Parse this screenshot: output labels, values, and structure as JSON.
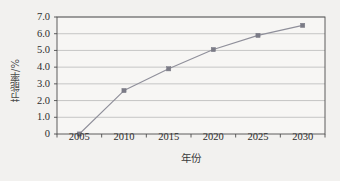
{
  "chart_data": {
    "type": "line",
    "title": "",
    "subtitle": "",
    "xlabel": "年份",
    "ylabel": "节能率/%",
    "categories": [
      "2005",
      "2010",
      "2015",
      "2020",
      "2025",
      "2030"
    ],
    "values": [
      0,
      2.6,
      3.9,
      5.05,
      5.9,
      6.5
    ],
    "series": [
      {
        "name": "节能率",
        "values": [
          0,
          2.6,
          3.9,
          5.05,
          5.9,
          6.5
        ]
      }
    ],
    "ylim": [
      0,
      7.0
    ],
    "ytick_labels": [
      "7.0",
      "6.0",
      "5.0",
      "4.0",
      "3.0",
      "2.0",
      "1.0",
      "0"
    ],
    "ytick_values": [
      7.0,
      6.0,
      5.0,
      4.0,
      3.0,
      2.0,
      1.0,
      0
    ],
    "grid": "horizontal",
    "legend": "none",
    "marker": "square",
    "colors": {
      "line": "#8f8f9a",
      "marker": "#7b7b86",
      "grid": "#b9b9b9",
      "axis": "#4d4d4d",
      "background": "#f2f1ef",
      "plot_background": "#f7f6f4",
      "text": "#2d2d2d"
    }
  }
}
